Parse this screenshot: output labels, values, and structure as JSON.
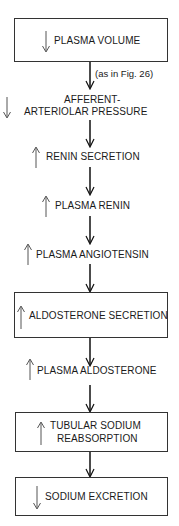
{
  "diagram": {
    "type": "flowchart",
    "nodes": [
      {
        "id": "plasma_volume",
        "label": "PLASMA VOLUME",
        "direction": "down",
        "boxed": true
      },
      {
        "id": "afferent_pressure",
        "label_line1": "AFFERENT-",
        "label_line2": "ARTERIOLAR PRESSURE",
        "direction": "down",
        "boxed": false
      },
      {
        "id": "renin_secretion",
        "label": "RENIN SECRETION",
        "direction": "up",
        "boxed": false
      },
      {
        "id": "plasma_renin",
        "label": "PLASMA RENIN",
        "direction": "up",
        "boxed": false
      },
      {
        "id": "plasma_angiotensin",
        "label": "PLASMA ANGIOTENSIN",
        "direction": "up",
        "boxed": false
      },
      {
        "id": "aldosterone_secretion",
        "label": "ALDOSTERONE SECRETION",
        "direction": "up",
        "boxed": true
      },
      {
        "id": "plasma_aldosterone",
        "label": "PLASMA ALDOSTERONE",
        "direction": "up",
        "boxed": false
      },
      {
        "id": "tubular_sodium",
        "label_line1": "TUBULAR SODIUM",
        "label_line2": "REABSORPTION",
        "direction": "up",
        "boxed": true
      },
      {
        "id": "sodium_excretion",
        "label": "SODIUM EXCRETION",
        "direction": "down",
        "boxed": true
      }
    ],
    "edge_notes": {
      "plasma_volume_to_afferent": "(as in Fig. 26)"
    },
    "colors": {
      "line": "#111111",
      "indicator": "#555555",
      "border": "#333333"
    }
  }
}
